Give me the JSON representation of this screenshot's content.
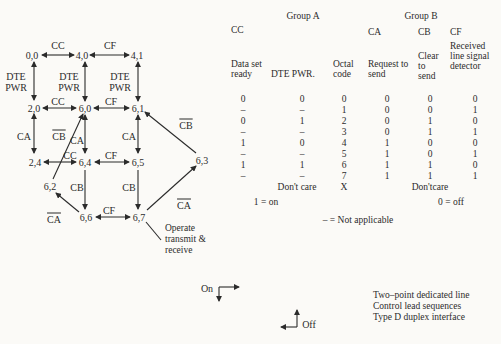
{
  "colors": {
    "ink": "#2b2b2b",
    "background": "#fbfaf7"
  },
  "diagram": {
    "nodes": {
      "n00": "0,0",
      "n40": "4,0",
      "n41": "4,1",
      "n20": "2,0",
      "n60": "6,0",
      "n61": "6,1",
      "n24": "2,4",
      "n64": "6,4",
      "n65": "6,5",
      "n63": "6,3",
      "n62": "6,2",
      "n66": "6,6",
      "n67": "6,7"
    },
    "edge_labels": {
      "cc": "CC",
      "cf": "CF",
      "dte_pwr": "DTE PWR",
      "ca": "CA",
      "cb": "CB",
      "cb_not": "CB",
      "ca_not": "CA"
    },
    "operate_note": "Operate transmit & receive"
  },
  "legend": {
    "on": "On",
    "off": "Off"
  },
  "table": {
    "group_a": "Group A",
    "group_b": "Group B",
    "code_headers": {
      "cc": "CC",
      "ca": "CA",
      "cb": "CB",
      "cf": "CF"
    },
    "column_titles": {
      "cc": "Data set ready",
      "dte": "DTE PWR.",
      "oct": "Octal code",
      "ca": "Request to send",
      "cb": "Clear to send",
      "cf": "Received line signal detector"
    },
    "rows": [
      {
        "cc": "0",
        "dte": "0",
        "oct": "0",
        "ca": "0",
        "cb": "0",
        "cf": "0"
      },
      {
        "cc": "–",
        "dte": "–",
        "oct": "1",
        "ca": "0",
        "cb": "0",
        "cf": "1"
      },
      {
        "cc": "0",
        "dte": "1",
        "oct": "2",
        "ca": "0",
        "cb": "1",
        "cf": "0"
      },
      {
        "cc": "–",
        "dte": "–",
        "oct": "3",
        "ca": "0",
        "cb": "1",
        "cf": "1"
      },
      {
        "cc": "1",
        "dte": "0",
        "oct": "4",
        "ca": "1",
        "cb": "0",
        "cf": "0"
      },
      {
        "cc": "–",
        "dte": "–",
        "oct": "5",
        "ca": "1",
        "cb": "0",
        "cf": "1"
      },
      {
        "cc": "1",
        "dte": "1",
        "oct": "6",
        "ca": "1",
        "cb": "1",
        "cf": "0"
      },
      {
        "cc": "–",
        "dte": "–",
        "oct": "7",
        "ca": "1",
        "cb": "1",
        "cf": "1"
      }
    ],
    "dont_care_left": "Don't care",
    "dont_care_code": "X",
    "dont_care_right": "Don'tcare",
    "footnotes": {
      "one_on": "1 = on",
      "zero_off": "0 = off",
      "dash_na": "– = Not applicable"
    }
  },
  "caption": {
    "lines": [
      "Two–point dedicated line",
      "Control lead sequences",
      "Type D duplex interface"
    ]
  }
}
